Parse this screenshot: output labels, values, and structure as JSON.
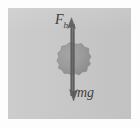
{
  "figure": {
    "kind": "free-body-diagram",
    "background_color": "#c9c9c9",
    "page_color": "#fdfdfd",
    "ink_color": "#555555",
    "ball_color": "#9a9a9a",
    "ball_edge_color": "#8a8a8a"
  },
  "labels": {
    "buoyant_force": {
      "base": "F",
      "subscript": "b",
      "meaning": "buoyant force"
    },
    "weight": {
      "text": "mg",
      "meaning": "weight"
    }
  },
  "vectors": [
    {
      "name": "buoyant-force-arrow",
      "label": "F_b",
      "direction": "up",
      "tip_y": 10,
      "tail_y": 88
    },
    {
      "name": "weight-arrow",
      "label": "mg",
      "direction": "down",
      "tip_y": 92,
      "tail_y": 14
    }
  ],
  "body": {
    "name": "ball",
    "shape": "circle",
    "center_x": 64,
    "center_y": 52,
    "radius": 17
  }
}
